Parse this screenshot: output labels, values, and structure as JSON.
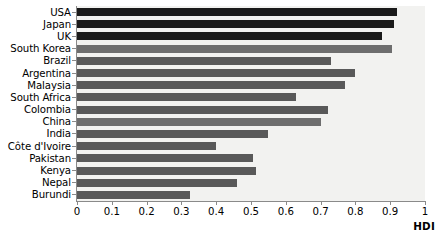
{
  "chart_data": {
    "type": "bar",
    "orientation": "horizontal",
    "title": "",
    "xlabel": "HDI",
    "ylabel": "",
    "xlim": [
      0,
      1
    ],
    "xticks": [
      0,
      0.1,
      0.2,
      0.3,
      0.4,
      0.5,
      0.6,
      0.7,
      0.8,
      0.9,
      1
    ],
    "xticklabels": [
      "0",
      "0.1",
      "0.2",
      "0.3",
      "0.4",
      "0.5",
      "0.6",
      "0.7",
      "0.8",
      "0.9",
      "1"
    ],
    "grid": false,
    "legend": null,
    "categories": [
      "USA",
      "Japan",
      "UK",
      "South Korea",
      "Brazil",
      "Argentina",
      "Malaysia",
      "South Africa",
      "Colombia",
      "China",
      "India",
      "Côte d'Ivoire",
      "Pakistan",
      "Kenya",
      "Nepal",
      "Burundi"
    ],
    "values": [
      0.92,
      0.91,
      0.875,
      0.905,
      0.73,
      0.8,
      0.77,
      0.63,
      0.72,
      0.7,
      0.55,
      0.4,
      0.505,
      0.515,
      0.46,
      0.325
    ],
    "bar_shades": [
      "dark",
      "dark",
      "dark",
      "mid",
      "normal",
      "normal",
      "normal",
      "normal",
      "normal",
      "mid",
      "normal",
      "normal",
      "normal",
      "normal",
      "normal",
      "normal"
    ],
    "colors": {
      "bar_default": "#595959",
      "bar_dark": "#1a1a1a",
      "bar_mid": "#6e6e6e",
      "plot_background": "#f2f2f0",
      "axis": "#8a8a8a",
      "text": "#000000"
    }
  }
}
